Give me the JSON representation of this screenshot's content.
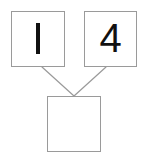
{
  "figure": {
    "name": "number-bond",
    "type": "number-bond-diagram",
    "background_color": "#ffffff",
    "border_color": "#9a9a9a",
    "text_color": "#111111",
    "connector_color": "#9a9a9a"
  },
  "parts": {
    "left": {
      "label": "1",
      "glyph_style": "plain-vertical-stroke",
      "filled": true
    },
    "right": {
      "label": "4",
      "glyph_style": "open-top-four",
      "filled": true
    }
  },
  "whole": {
    "label": "",
    "filled": false,
    "is_answer_blank": true
  },
  "connectors": [
    {
      "name": "left-branch",
      "from_x": 42,
      "from_y": 67,
      "to_x": 74,
      "to_y": 96
    },
    {
      "name": "right-branch",
      "from_x": 106,
      "from_y": 67,
      "to_x": 74,
      "to_y": 96
    }
  ]
}
